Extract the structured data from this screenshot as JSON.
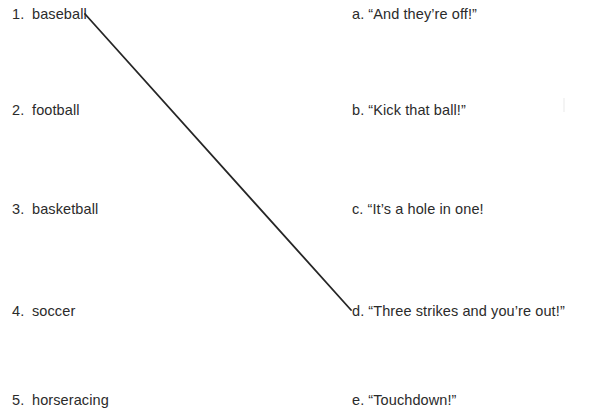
{
  "worksheet": {
    "type": "matching-exercise",
    "background_color": "#ffffff",
    "text_color": "#2b2b2b",
    "left_column": {
      "name": "sports-list",
      "items": [
        {
          "marker": "1.",
          "label": "baseball",
          "top": 5
        },
        {
          "marker": "2.",
          "label": "football",
          "top": 101
        },
        {
          "marker": "3.",
          "label": "basketball",
          "top": 200
        },
        {
          "marker": "4.",
          "label": "soccer",
          "top": 302
        },
        {
          "marker": "5.",
          "label": "horseracing",
          "top": 391
        }
      ]
    },
    "right_column": {
      "name": "phrases-list",
      "items": [
        {
          "marker": "a.",
          "label": "“And they’re off!”",
          "top": 5
        },
        {
          "marker": "b.",
          "label": "“Kick that ball!”",
          "top": 101
        },
        {
          "marker": "c.",
          "label": "“It’s a hole in one!",
          "top": 200
        },
        {
          "marker": "d.",
          "label": "“Three strikes and you’re out!”",
          "top": 302
        },
        {
          "marker": "e.",
          "label": "“Touchdown!”",
          "top": 391
        }
      ]
    },
    "connections": [
      {
        "name": "baseball-to-three-strikes",
        "from_item": "1. baseball",
        "to_item": "d. “Three strikes and you’re out!”",
        "x1": 85,
        "y1": 14,
        "x2": 351,
        "y2": 310,
        "stroke": "#262626"
      }
    ]
  }
}
